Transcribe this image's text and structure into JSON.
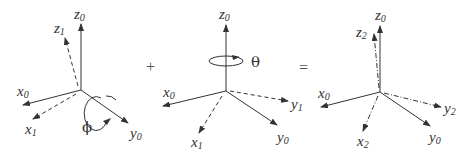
{
  "diagram": {
    "operators": {
      "plus": "+",
      "equals": "="
    },
    "frame1": {
      "axes": [
        {
          "base": "z",
          "sub": "0",
          "style": "solid"
        },
        {
          "base": "z",
          "sub": "1",
          "style": "dashed"
        },
        {
          "base": "x",
          "sub": "0",
          "style": "solid"
        },
        {
          "base": "x",
          "sub": "1",
          "style": "dashed"
        },
        {
          "base": "y",
          "sub": "0",
          "style": "solid"
        }
      ],
      "rotation": {
        "symbol": "ϕ",
        "about": "y0"
      }
    },
    "frame2": {
      "axes": [
        {
          "base": "z",
          "sub": "0",
          "style": "solid"
        },
        {
          "base": "x",
          "sub": "0",
          "style": "solid"
        },
        {
          "base": "x",
          "sub": "1",
          "style": "dashed"
        },
        {
          "base": "y",
          "sub": "1",
          "style": "dashed"
        },
        {
          "base": "y",
          "sub": "0",
          "style": "solid"
        }
      ],
      "rotation": {
        "symbol": "θ",
        "about": "z0"
      }
    },
    "frame3": {
      "axes": [
        {
          "base": "z",
          "sub": "0",
          "style": "solid"
        },
        {
          "base": "z",
          "sub": "2",
          "style": "dash-dot"
        },
        {
          "base": "x",
          "sub": "0",
          "style": "solid"
        },
        {
          "base": "x",
          "sub": "2",
          "style": "dash-dot"
        },
        {
          "base": "y",
          "sub": "2",
          "style": "dash-dot"
        },
        {
          "base": "y",
          "sub": "0",
          "style": "solid"
        }
      ]
    }
  }
}
